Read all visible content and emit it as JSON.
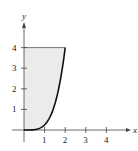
{
  "chart_data": {
    "type": "area",
    "title": "",
    "xlabel": "x",
    "ylabel": "y",
    "xlim": [
      0,
      4.6
    ],
    "ylim": [
      0,
      4.8
    ],
    "x_ticks": [
      1,
      2,
      3,
      4
    ],
    "y_ticks": [
      1,
      2,
      3,
      4
    ],
    "grid": false,
    "curve": {
      "description": "y = x^4/4 for 0 <= x <= 2",
      "x": [
        0,
        0.25,
        0.5,
        0.75,
        1.0,
        1.25,
        1.5,
        1.75,
        2.0
      ],
      "y": [
        0,
        0.001,
        0.016,
        0.079,
        0.25,
        0.61,
        1.27,
        2.35,
        4.0
      ]
    },
    "region": {
      "description": "Shaded region bounded by the y-axis, the line y = 4, and the curve",
      "top_line_y": 4,
      "x_range": [
        0,
        2
      ]
    },
    "colors": {
      "fill": "#ebebeb",
      "curve": "#111111",
      "axis": "#444444"
    }
  },
  "labels": {
    "x_axis": "x",
    "y_axis": "y",
    "x_tick_labels": [
      "1",
      "2",
      "3",
      "4"
    ],
    "y_tick_labels": [
      "1",
      "2",
      "3",
      "4"
    ]
  }
}
